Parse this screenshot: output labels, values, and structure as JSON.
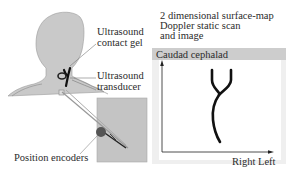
{
  "figure": {
    "left_panel": {
      "labels": {
        "gel": [
          "Ultrasound",
          "contact gel"
        ],
        "transducer": [
          "Ultrasound",
          "transducer"
        ],
        "encoders": "Position encoders"
      }
    },
    "right_panel": {
      "title": [
        "2 dimensional surface-map",
        "Doppler static scan",
        "and image"
      ],
      "header": "Caudad cephalad",
      "x_axis_label": "Right Left"
    },
    "colors": {
      "skin": "#c8c8c8",
      "panel": "#c4c4c4",
      "header_bar": "#cdcdcd",
      "vessel": "#111111",
      "encoder_dot": "#555555"
    }
  }
}
